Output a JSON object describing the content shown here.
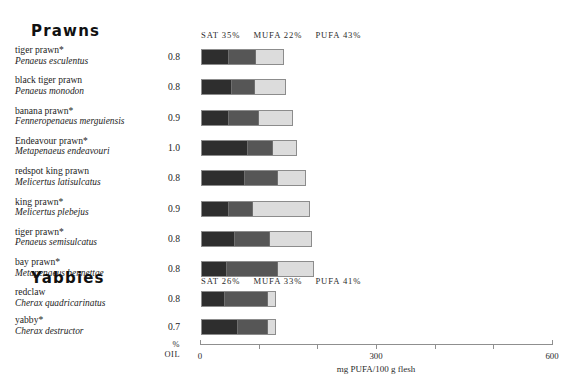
{
  "groups": [
    {
      "title": "Prawns",
      "legend": {
        "sat": "SAT 35%",
        "mufa": "MUFA 22%",
        "pufa": "PUFA  43%"
      },
      "rows": [
        {
          "common": "tiger prawn*",
          "sci": "Penaeus esculentus",
          "oil": "0.8",
          "sat_px": 26,
          "mufa_px": 26,
          "pufa_px": 27
        },
        {
          "common": "black tiger prawn",
          "sci": "Penaeus monodon",
          "oil": "0.8",
          "sat_px": 29,
          "mufa_px": 22,
          "pufa_px": 30
        },
        {
          "common": "banana prawn*",
          "sci": "Fenneropenaeus merguiensis",
          "oil": "0.9",
          "sat_px": 26,
          "mufa_px": 29,
          "pufa_px": 33
        },
        {
          "common": "Endeavour prawn*",
          "sci": "Metapenaeus endeavouri",
          "oil": "1.0",
          "sat_px": 45,
          "mufa_px": 24,
          "pufa_px": 23
        },
        {
          "common": "redspot king prawn",
          "sci": "Melicertus latisulcatus",
          "oil": "0.8",
          "sat_px": 42,
          "mufa_px": 32,
          "pufa_px": 27
        },
        {
          "common": "king prawn*",
          "sci": "Melicertus plebejus",
          "oil": "0.9",
          "sat_px": 26,
          "mufa_px": 23,
          "pufa_px": 56
        },
        {
          "common": "tiger prawn*",
          "sci": "Penaeus semisulcatus",
          "oil": "0.8",
          "sat_px": 32,
          "mufa_px": 34,
          "pufa_px": 41
        },
        {
          "common": "bay prawn*",
          "sci": "Metapenaeus bennettae",
          "oil": "0.8",
          "sat_px": 24,
          "mufa_px": 50,
          "pufa_px": 35
        }
      ]
    },
    {
      "title": "Yabbies",
      "legend": {
        "sat": "SAT 26%",
        "mufa": "MUFA 33%",
        "pufa": "PUFA  41%"
      },
      "rows": [
        {
          "common": "redclaw",
          "sci": "Cherax quadricarinatus",
          "oil": "0.8",
          "sat_px": 22,
          "mufa_px": 42,
          "pufa_px": 7
        },
        {
          "common": "yabby*",
          "sci": "Cherax destructor",
          "oil": "0.7",
          "sat_px": 35,
          "mufa_px": 29,
          "pufa_px": 7
        }
      ]
    }
  ],
  "axis": {
    "oil_percent_label": "%",
    "oil_label": "OIL",
    "caption": "mg PUFA/100 g flesh",
    "ticks": [
      {
        "value": 0,
        "label": "0"
      },
      {
        "value": 100,
        "label": ""
      },
      {
        "value": 200,
        "label": ""
      },
      {
        "value": 300,
        "label": "300"
      },
      {
        "value": 400,
        "label": ""
      },
      {
        "value": 500,
        "label": ""
      },
      {
        "value": 600,
        "label": "600"
      }
    ],
    "min": 0,
    "max": 600
  },
  "chart_data": {
    "type": "bar",
    "title": "",
    "xlabel": "mg PUFA/100 g flesh",
    "ylabel": "",
    "xlim": [
      0,
      600
    ],
    "grid": false,
    "legend_position": "top",
    "stacked": true,
    "series": [
      {
        "name": "SAT",
        "color": "#2e2e2e"
      },
      {
        "name": "MUFA",
        "color": "#565656"
      },
      {
        "name": "PUFA",
        "color": "#dcdcdc"
      }
    ],
    "groups": [
      {
        "name": "Prawns",
        "average_composition": {
          "SAT": 35,
          "MUFA": 22,
          "PUFA": 43
        },
        "categories": [
          "Penaeus esculentus",
          "Penaeus monodon",
          "Fenneropenaeus merguiensis",
          "Metapenaeus endeavouri",
          "Melicertus latisulcatus",
          "Melicertus plebejus",
          "Penaeus semisulcatus",
          "Metapenaeus bennettae"
        ],
        "percent_oil": [
          0.8,
          0.8,
          0.9,
          1.0,
          0.8,
          0.9,
          0.8,
          0.8
        ],
        "values_mg_per_100g": {
          "SAT": [
            44,
            49,
            44,
            77,
            72,
            44,
            55,
            41
          ],
          "MUFA": [
            44,
            38,
            49,
            41,
            55,
            39,
            58,
            85
          ],
          "PUFA": [
            46,
            51,
            56,
            39,
            46,
            95,
            70,
            60
          ]
        },
        "totals_mg_per_100g": [
          134,
          138,
          149,
          157,
          173,
          178,
          183,
          186
        ]
      },
      {
        "name": "Yabbies",
        "average_composition": {
          "SAT": 26,
          "MUFA": 33,
          "PUFA": 41
        },
        "categories": [
          "Cherax quadricarinatus",
          "Cherax destructor"
        ],
        "percent_oil": [
          0.8,
          0.7
        ],
        "values_mg_per_100g": {
          "SAT": [
            38,
            60
          ],
          "MUFA": [
            72,
            49
          ],
          "PUFA": [
            12,
            12
          ]
        },
        "totals_mg_per_100g": [
          122,
          121
        ]
      }
    ]
  }
}
